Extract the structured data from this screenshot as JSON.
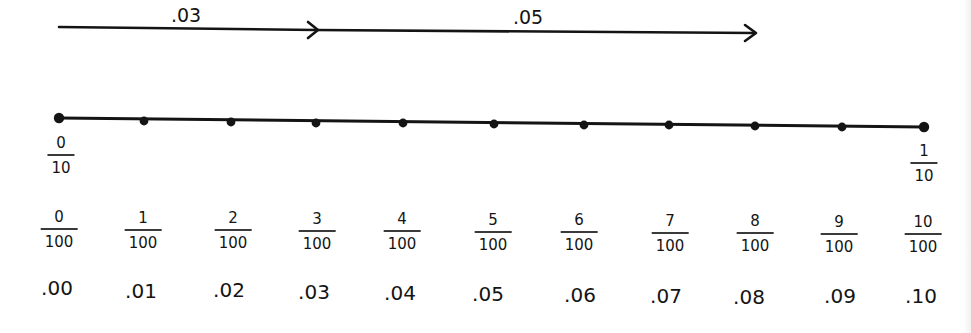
{
  "arrows": [
    {
      "label": ".03",
      "from_value": 0.0,
      "to_value": 0.03
    },
    {
      "label": ".05",
      "from_value": 0.03,
      "to_value": 0.08
    }
  ],
  "number_line": {
    "start_fraction": {
      "numerator": "0",
      "denominator": "10"
    },
    "end_fraction": {
      "numerator": "1",
      "denominator": "10"
    },
    "tick_count": 11
  },
  "ticks": [
    {
      "numerator": "0",
      "denominator": "100",
      "decimal": ".00"
    },
    {
      "numerator": "1",
      "denominator": "100",
      "decimal": ".01"
    },
    {
      "numerator": "2",
      "denominator": "100",
      "decimal": ".02"
    },
    {
      "numerator": "3",
      "denominator": "100",
      "decimal": ".03"
    },
    {
      "numerator": "4",
      "denominator": "100",
      "decimal": ".04"
    },
    {
      "numerator": "5",
      "denominator": "100",
      "decimal": ".05"
    },
    {
      "numerator": "6",
      "denominator": "100",
      "decimal": ".06"
    },
    {
      "numerator": "7",
      "denominator": "100",
      "decimal": ".07"
    },
    {
      "numerator": "8",
      "denominator": "100",
      "decimal": ".08"
    },
    {
      "numerator": "9",
      "denominator": "100",
      "decimal": ".09"
    },
    {
      "numerator": "10",
      "denominator": "100",
      "decimal": ".10"
    }
  ],
  "colors": {
    "ink": "#141414",
    "background": "#ffffff"
  }
}
